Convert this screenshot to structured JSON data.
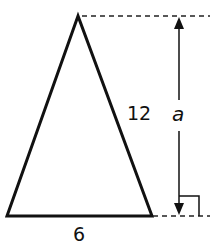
{
  "diagram": {
    "type": "isosceles-triangle",
    "labels": {
      "side": "12",
      "height": "a",
      "base": "6"
    },
    "colors": {
      "stroke": "#111111",
      "background": "#ffffff"
    }
  }
}
